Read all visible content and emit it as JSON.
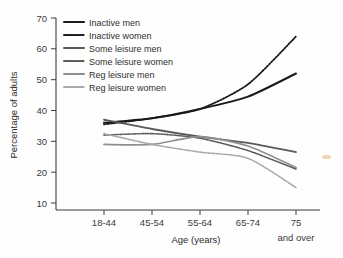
{
  "chart_data": {
    "type": "line",
    "title": "",
    "xlabel": "Age (years)",
    "ylabel": "Percentage of adults",
    "categories": [
      "18-44",
      "45-54",
      "55-64",
      "65-74",
      "75 and over"
    ],
    "xtick_labels": [
      "18-44",
      "45-54",
      "55-64",
      "65-74",
      "75"
    ],
    "xtick_sublabel": "and over",
    "ytick_labels": [
      "70",
      "60",
      "50",
      "40",
      "30",
      "20",
      "10"
    ],
    "ytick_values": [
      70,
      60,
      50,
      40,
      30,
      20,
      10
    ],
    "ylim": [
      10,
      70
    ],
    "grid": false,
    "legend_position": "top-left",
    "series": [
      {
        "name": "Inactive men",
        "values": [
          36,
          37.5,
          40.5,
          44.5,
          52
        ],
        "color": "#1a1a1a",
        "style": "solid",
        "width": 2.0
      },
      {
        "name": "Inactive women",
        "values": [
          35.5,
          37.5,
          40.5,
          48.5,
          64
        ],
        "color": "#1a1a1a",
        "style": "dotted",
        "width": 1.8
      },
      {
        "name": "Some leisure men",
        "values": [
          37,
          34,
          31.5,
          29.5,
          26.5
        ],
        "color": "#5a5a5a",
        "style": "solid",
        "width": 1.8
      },
      {
        "name": "Some leisure women",
        "values": [
          32,
          32.5,
          31,
          27,
          21
        ],
        "color": "#5a5a5a",
        "style": "dotted",
        "width": 1.6
      },
      {
        "name": "Reg leisure men",
        "values": [
          29,
          29,
          31.5,
          28.5,
          21.5
        ],
        "color": "#8f8f8f",
        "style": "solid",
        "width": 1.7
      },
      {
        "name": "Reg leisure women",
        "values": [
          32.5,
          29,
          26.5,
          24.5,
          15
        ],
        "color": "#a8a8a8",
        "style": "dotted",
        "width": 1.6
      }
    ]
  },
  "colors": {
    "axis": "#3b3b3b",
    "text": "#2b2b2b",
    "background": "#fefefe"
  }
}
